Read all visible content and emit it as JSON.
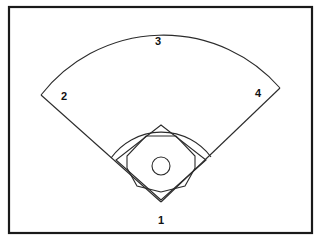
{
  "diagram": {
    "background_color": "#ffffff",
    "line_color": "#2b2b2b",
    "border_color": "#1a1a1a",
    "label_color": "#111111",
    "frame": {
      "x": 9,
      "y": 7,
      "width": 303,
      "height": 226
    },
    "labels": [
      {
        "id": "base-1",
        "text": "1",
        "x": 161,
        "y": 221,
        "meaning": "home-plate"
      },
      {
        "id": "base-2",
        "text": "2",
        "x": 64,
        "y": 97,
        "meaning": "third-base-corner"
      },
      {
        "id": "base-3",
        "text": "3",
        "x": 158,
        "y": 42,
        "meaning": "center-field"
      },
      {
        "id": "base-4",
        "text": "4",
        "x": 258,
        "y": 94,
        "meaning": "first-base-corner"
      }
    ],
    "shapes": {
      "outfield_fence": {
        "name": "outfield-fence-arc",
        "path": "M 41 95 A 155 155 0 0 1 280 88"
      },
      "foul_line_left": {
        "name": "foul-line-left",
        "path": "M 41 95 L 161 202"
      },
      "foul_line_right": {
        "name": "foul-line-right",
        "path": "M 280 88 L 161 202"
      },
      "infield_grass_arc": {
        "name": "infield-grass-arc",
        "path": "M 111 158 A 62 62 0 0 1 211 157"
      },
      "base_path_diamond": {
        "name": "base-path-diamond",
        "path": "M 161 200 L 116 160 L 161 125 L 206 160 Z"
      },
      "infield_dirt_octagon": {
        "name": "infield-dirt-octagon",
        "path": "M 161 192 L 137 186 L 127 168 L 127 156 L 146 136 L 176 136 L 195 156 L 195 168 L 185 186 Z"
      },
      "pitchers_mound": {
        "name": "pitchers-mound-circle",
        "cx": 161,
        "cy": 166,
        "r": 9
      }
    }
  }
}
